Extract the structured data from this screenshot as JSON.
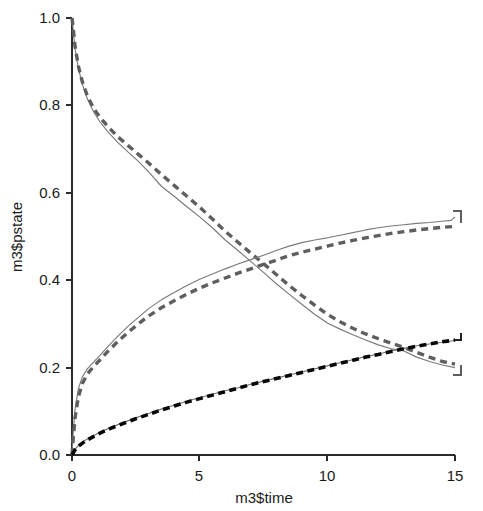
{
  "chart_data": {
    "type": "line",
    "title": "",
    "xlabel": "m3$time",
    "ylabel": "m3$pstate",
    "xlim": [
      0,
      15
    ],
    "ylim": [
      0,
      1
    ],
    "xticks": [
      "0",
      "5",
      "10",
      "15"
    ],
    "xtick_values": [
      0,
      5,
      10,
      15
    ],
    "yticks": [
      "0.0",
      "0.2",
      "0.4",
      "0.6",
      "0.8",
      "1.0"
    ],
    "ytick_values": [
      0,
      0.2,
      0.4,
      0.6,
      0.8,
      1.0
    ],
    "grid": false,
    "legend": "none",
    "series": [
      {
        "name": "state-1-empirical",
        "style": "solid-gray-thin",
        "color": "#7a7a7a",
        "x": [
          0,
          0.05,
          0.12,
          0.25,
          0.4,
          0.6,
          0.85,
          1.1,
          1.4,
          1.8,
          2.2,
          2.6,
          3.0,
          3.5,
          4.0,
          4.5,
          5.0,
          5.5,
          6.0,
          6.5,
          7.0,
          7.5,
          8.0,
          8.5,
          9.0,
          9.5,
          10.0,
          10.5,
          11.0,
          11.5,
          12.0,
          12.5,
          13.0,
          13.5,
          14.0,
          14.5,
          15.0
        ],
        "y": [
          1.0,
          0.97,
          0.93,
          0.885,
          0.85,
          0.815,
          0.785,
          0.762,
          0.74,
          0.715,
          0.693,
          0.672,
          0.648,
          0.615,
          0.592,
          0.568,
          0.545,
          0.52,
          0.492,
          0.468,
          0.443,
          0.418,
          0.392,
          0.368,
          0.345,
          0.322,
          0.302,
          0.288,
          0.275,
          0.263,
          0.252,
          0.243,
          0.238,
          0.224,
          0.214,
          0.206,
          0.2
        ]
      },
      {
        "name": "state-1-model",
        "style": "dashed-gray-thick",
        "color": "#5e5e5e",
        "x": [
          0,
          0.05,
          0.12,
          0.25,
          0.4,
          0.6,
          0.85,
          1.1,
          1.4,
          1.8,
          2.2,
          2.6,
          3.0,
          3.5,
          4.0,
          4.5,
          5.0,
          5.5,
          6.0,
          6.5,
          7.0,
          7.5,
          8.0,
          8.5,
          9.0,
          9.5,
          10.0,
          10.5,
          11.0,
          11.5,
          12.0,
          12.5,
          13.0,
          13.5,
          14.0,
          14.5,
          15.0
        ],
        "y": [
          1.0,
          0.975,
          0.935,
          0.89,
          0.855,
          0.822,
          0.793,
          0.772,
          0.752,
          0.728,
          0.708,
          0.688,
          0.668,
          0.642,
          0.617,
          0.592,
          0.567,
          0.54,
          0.512,
          0.487,
          0.462,
          0.438,
          0.413,
          0.388,
          0.365,
          0.343,
          0.322,
          0.305,
          0.29,
          0.277,
          0.266,
          0.256,
          0.246,
          0.235,
          0.224,
          0.214,
          0.208
        ]
      },
      {
        "name": "state-2-empirical",
        "style": "solid-gray-thin",
        "color": "#7a7a7a",
        "x": [
          0,
          0.05,
          0.12,
          0.25,
          0.4,
          0.6,
          0.85,
          1.1,
          1.4,
          1.8,
          2.2,
          2.6,
          3.0,
          3.5,
          4.0,
          4.5,
          5.0,
          5.5,
          6.0,
          6.5,
          7.0,
          7.5,
          8.0,
          8.5,
          9.0,
          9.5,
          10.0,
          10.5,
          11.0,
          11.5,
          12.0,
          12.5,
          13.0,
          13.5,
          14.0,
          14.5,
          14.85,
          15.0
        ],
        "y": [
          0.0,
          0.055,
          0.105,
          0.152,
          0.178,
          0.197,
          0.213,
          0.228,
          0.248,
          0.272,
          0.295,
          0.315,
          0.335,
          0.355,
          0.372,
          0.388,
          0.402,
          0.414,
          0.426,
          0.437,
          0.447,
          0.457,
          0.468,
          0.478,
          0.486,
          0.492,
          0.497,
          0.503,
          0.509,
          0.515,
          0.52,
          0.524,
          0.527,
          0.53,
          0.532,
          0.535,
          0.537,
          0.545
        ]
      },
      {
        "name": "state-2-model",
        "style": "dashed-gray-thick",
        "color": "#5e5e5e",
        "x": [
          0,
          0.05,
          0.12,
          0.25,
          0.4,
          0.6,
          0.85,
          1.1,
          1.4,
          1.8,
          2.2,
          2.6,
          3.0,
          3.5,
          4.0,
          4.5,
          5.0,
          5.5,
          6.0,
          6.5,
          7.0,
          7.5,
          8.0,
          8.5,
          9.0,
          9.5,
          10.0,
          10.5,
          11.0,
          11.5,
          12.0,
          12.5,
          13.0,
          13.5,
          14.0,
          14.5,
          15.0
        ],
        "y": [
          0.0,
          0.04,
          0.085,
          0.133,
          0.163,
          0.185,
          0.203,
          0.218,
          0.237,
          0.26,
          0.281,
          0.3,
          0.318,
          0.337,
          0.353,
          0.368,
          0.382,
          0.394,
          0.405,
          0.416,
          0.426,
          0.436,
          0.446,
          0.456,
          0.464,
          0.471,
          0.478,
          0.485,
          0.491,
          0.497,
          0.502,
          0.507,
          0.511,
          0.515,
          0.518,
          0.521,
          0.523
        ]
      },
      {
        "name": "state-3-empirical",
        "style": "solid-gray-thin",
        "color": "#6f6f6f",
        "x": [
          0,
          0.1,
          0.25,
          0.5,
          0.8,
          1.2,
          1.6,
          2.0,
          2.5,
          3.0,
          3.5,
          4.0,
          4.5,
          5.0,
          5.5,
          6.0,
          6.5,
          7.0,
          7.5,
          8.0,
          8.5,
          9.0,
          9.5,
          10.0,
          10.5,
          11.0,
          11.5,
          12.0,
          12.5,
          13.0,
          13.5,
          14.0,
          14.5,
          15.0
        ],
        "y": [
          0.0,
          0.012,
          0.022,
          0.033,
          0.043,
          0.055,
          0.065,
          0.074,
          0.085,
          0.095,
          0.105,
          0.114,
          0.123,
          0.131,
          0.139,
          0.147,
          0.154,
          0.162,
          0.169,
          0.176,
          0.183,
          0.19,
          0.197,
          0.204,
          0.211,
          0.218,
          0.225,
          0.231,
          0.238,
          0.244,
          0.25,
          0.254,
          0.258,
          0.262
        ]
      },
      {
        "name": "state-3-model",
        "style": "dashed-black-thick",
        "color": "#080808",
        "x": [
          0,
          0.1,
          0.25,
          0.5,
          0.8,
          1.2,
          1.6,
          2.0,
          2.5,
          3.0,
          3.5,
          4.0,
          4.5,
          5.0,
          5.5,
          6.0,
          6.5,
          7.0,
          7.5,
          8.0,
          8.5,
          9.0,
          9.5,
          10.0,
          10.5,
          11.0,
          11.5,
          12.0,
          12.5,
          13.0,
          13.5,
          14.0,
          14.5,
          15.0
        ],
        "y": [
          0.0,
          0.01,
          0.02,
          0.031,
          0.041,
          0.053,
          0.063,
          0.072,
          0.083,
          0.093,
          0.103,
          0.112,
          0.121,
          0.129,
          0.137,
          0.145,
          0.153,
          0.161,
          0.168,
          0.175,
          0.182,
          0.189,
          0.196,
          0.203,
          0.21,
          0.217,
          0.224,
          0.23,
          0.237,
          0.243,
          0.249,
          0.254,
          0.259,
          0.263
        ]
      }
    ],
    "end_markers": [
      {
        "name": "state-2-empirical-end",
        "x": 15,
        "y": 0.545
      },
      {
        "name": "state-2-model-end",
        "x": 15,
        "y": 0.523
      },
      {
        "name": "state-3-model-end",
        "x": 15,
        "y": 0.263
      },
      {
        "name": "state-1-end",
        "x": 15,
        "y": 0.2
      }
    ]
  }
}
